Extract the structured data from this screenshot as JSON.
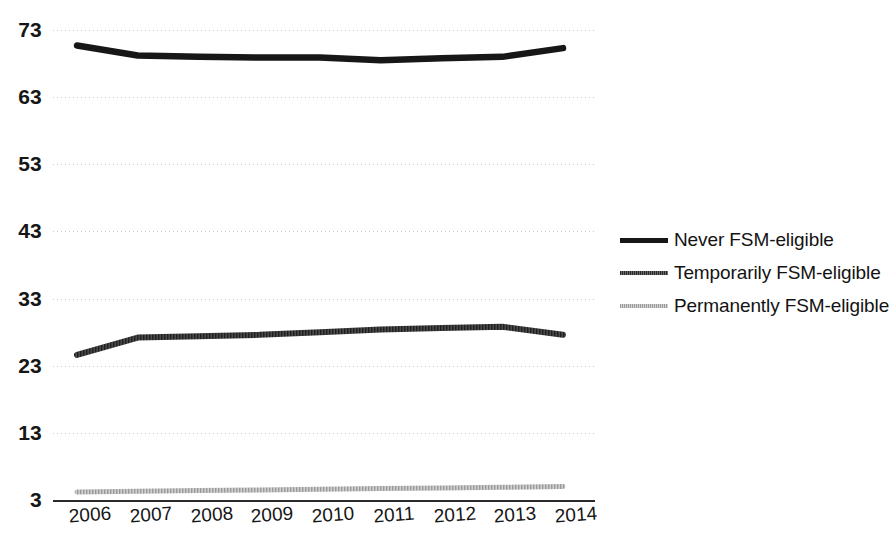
{
  "chart_data": {
    "type": "line",
    "title": "",
    "xlabel": "",
    "ylabel": "",
    "categories": [
      "2006",
      "2007",
      "2008",
      "2009",
      "2010",
      "2011",
      "2012",
      "2013",
      "2014"
    ],
    "x": [
      2006,
      2007,
      2008,
      2009,
      2010,
      2011,
      2012,
      2013,
      2014
    ],
    "ylim": [
      3,
      73
    ],
    "xlim": [
      2006,
      2014
    ],
    "yticks": [
      3,
      13,
      23,
      33,
      43,
      53,
      63,
      73
    ],
    "ytick_labels": [
      "3",
      "13",
      "23",
      "33",
      "43",
      "53",
      "63",
      "73"
    ],
    "grid": true,
    "grid_style": "dotted",
    "legend_position": "right",
    "series": [
      {
        "name": "Never FSM-eligible",
        "color": "#171717",
        "style": "solid-thick",
        "values": [
          70.7,
          69.2,
          69.0,
          68.9,
          68.9,
          68.5,
          68.8,
          69.0,
          70.3
        ]
      },
      {
        "name": "Temporarily FSM-eligible",
        "color": "#3c3c3c",
        "style": "textured-medium",
        "values": [
          24.6,
          27.2,
          27.4,
          27.6,
          28.0,
          28.4,
          28.6,
          28.8,
          27.6
        ]
      },
      {
        "name": "Permanently FSM-eligible",
        "color": "#b5b5b5",
        "style": "textured-light",
        "values": [
          4.2,
          4.3,
          4.4,
          4.5,
          4.6,
          4.7,
          4.8,
          4.9,
          5.0
        ]
      }
    ]
  },
  "legend": {
    "items": [
      {
        "label": "Never FSM-eligible"
      },
      {
        "label": "Temporarily FSM-eligible"
      },
      {
        "label": "Permanently FSM-eligible"
      }
    ]
  }
}
